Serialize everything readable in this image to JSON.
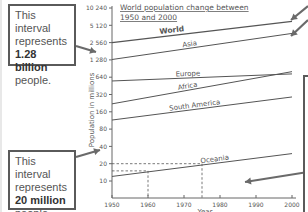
{
  "chart_data": {
    "type": "line",
    "title_lines": [
      "World population change between",
      "1950 and 2000"
    ],
    "xlabel": "Year",
    "ylabel": "Population in millions",
    "yscale": "log2",
    "ylim": [
      5,
      10240
    ],
    "xlim": [
      1950,
      2000
    ],
    "x_ticks": [
      "1950",
      "1960",
      "1970",
      "1980",
      "1990",
      "2000"
    ],
    "y_ticks": [
      "10",
      "20",
      "40",
      "80",
      "160",
      "320",
      "640",
      "1 280",
      "2 560",
      "5 120",
      "10 240"
    ],
    "x": [
      1950,
      2000
    ],
    "series": [
      {
        "name": "World",
        "values": [
          2560,
          6000
        ],
        "bold": true
      },
      {
        "name": "Asia",
        "values": [
          1300,
          3700
        ]
      },
      {
        "name": "Europe",
        "values": [
          550,
          730
        ]
      },
      {
        "name": "Africa",
        "values": [
          220,
          800
        ]
      },
      {
        "name": "South America",
        "values": [
          115,
          290
        ]
      },
      {
        "name": "Oceania",
        "values": [
          12,
          30
        ]
      }
    ],
    "annotations": [
      {
        "type": "dashed-guide",
        "x": 1960,
        "y": 15
      },
      {
        "type": "dashed-guide",
        "x": 1975,
        "y": 20
      }
    ],
    "grid": false,
    "legend": "inline labels"
  },
  "callouts": {
    "top": {
      "line1": "This interval",
      "line2": "represents",
      "bold": "1.28 billion",
      "line4": "people."
    },
    "bottom": {
      "line1": "This interval",
      "line2": "represents",
      "bold": "20 million",
      "line4": "people."
    }
  },
  "colors": {
    "line": "#555555",
    "axis": "#666666",
    "text": "#555555",
    "arrow": "#6a6a6a",
    "box_border": "#5a5a5a"
  }
}
